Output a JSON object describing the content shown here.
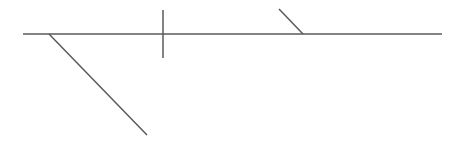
{
  "diagram": {
    "type": "sentence-diagram",
    "stroke_color": "#5a5a5a",
    "background_color": "#ffffff",
    "elements": [
      {
        "name": "baseline",
        "kind": "horizontal-line",
        "role": "main clause baseline"
      },
      {
        "name": "subject-predicate-divider",
        "kind": "vertical-line",
        "role": "divides subject from predicate"
      },
      {
        "name": "modifier-slant-left",
        "kind": "diagonal-line",
        "role": "modifier under subject"
      },
      {
        "name": "object-complement-slant",
        "kind": "diagonal-line",
        "role": "slanted line toward baseline (complement marker)"
      }
    ],
    "labels": []
  }
}
